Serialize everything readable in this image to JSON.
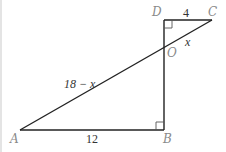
{
  "diagram": {
    "type": "geometry-figure",
    "points": {
      "A": {
        "label": "A",
        "x": 20,
        "y": 130
      },
      "B": {
        "label": "B",
        "x": 164,
        "y": 130
      },
      "D": {
        "label": "D",
        "x": 164,
        "y": 20
      },
      "C": {
        "label": "C",
        "x": 212,
        "y": 20
      },
      "O": {
        "label": "O",
        "x": 164,
        "y": 48
      }
    },
    "segments": [
      {
        "from": "A",
        "to": "B",
        "length_label": "12"
      },
      {
        "from": "B",
        "to": "D",
        "length_label": ""
      },
      {
        "from": "D",
        "to": "C",
        "length_label": "4"
      },
      {
        "from": "A",
        "to": "C",
        "length_label": ""
      }
    ],
    "measurements": {
      "AB": "12",
      "DC": "4",
      "OC": "x",
      "AO": "18 − x"
    },
    "right_angles": [
      "D",
      "B"
    ],
    "colors": {
      "stroke": "#222222",
      "point_label": "#8a8a8a",
      "measure_label": "#333333"
    }
  }
}
